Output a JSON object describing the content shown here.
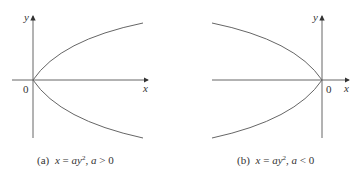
{
  "panels": [
    {
      "id": "a",
      "caption_prefix": "(a)",
      "caption_eq_x": "x",
      "caption_eq_eq": " = ",
      "caption_eq_a": "ay",
      "caption_eq_exp": "2",
      "caption_cond_sep": ",  ",
      "caption_cond_a": "a",
      "caption_cond_op": " > 0",
      "axis_x_label": "x",
      "axis_y_label": "y",
      "origin_label": "0",
      "opens": "right"
    },
    {
      "id": "b",
      "caption_prefix": "(b)",
      "caption_eq_x": "x",
      "caption_eq_eq": " = ",
      "caption_eq_a": "ay",
      "caption_eq_exp": "2",
      "caption_cond_sep": ",  ",
      "caption_cond_a": "a",
      "caption_cond_op": " < 0",
      "axis_x_label": "x",
      "axis_y_label": "y",
      "origin_label": "0",
      "opens": "left"
    }
  ],
  "colors": {
    "axis": "#555555",
    "curve": "#666666",
    "text": "#333333"
  }
}
